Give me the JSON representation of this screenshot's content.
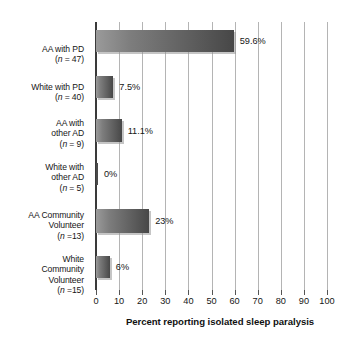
{
  "chart_data": {
    "type": "bar",
    "orientation": "horizontal",
    "title": "",
    "xlabel": "Percent reporting isolated sleep paralysis",
    "ylabel": "",
    "xlim": [
      0,
      100
    ],
    "xticks": [
      0,
      10,
      20,
      30,
      40,
      50,
      60,
      70,
      80,
      90,
      100
    ],
    "xtick_labels": [
      "0",
      "10",
      "20",
      "30",
      "40",
      "50",
      "60",
      "70",
      "80",
      "90",
      "100"
    ],
    "grid": "vertical",
    "legend": "none",
    "categories": [
      "AA with PD (n = 47)",
      "White with PD (n = 40)",
      "AA with other AD (n = 9)",
      "White with other AD (n = 5)",
      "AA Community Volunteer (n =13)",
      "White Community Volunteer (n =15)"
    ],
    "values": [
      59.6,
      7.5,
      11.1,
      0,
      23,
      6
    ],
    "value_labels": [
      "59.6%",
      "7.5%",
      "11.1%",
      "0%",
      "23%",
      "6%"
    ],
    "bars": [
      {
        "label_lines": [
          "AA with PD"
        ],
        "n_prefix": "(",
        "n_italic": "n",
        "n_suffix": " = 47)",
        "value": 59.6,
        "value_label": "59.6%",
        "top": 8,
        "height": 22
      },
      {
        "label_lines": [
          "White with PD"
        ],
        "n_prefix": "(",
        "n_italic": "n",
        "n_suffix": " = 40)",
        "value": 7.5,
        "value_label": "7.5%",
        "top": 54,
        "height": 22
      },
      {
        "label_lines": [
          "AA with",
          "other AD"
        ],
        "n_prefix": "(",
        "n_italic": "n",
        "n_suffix": " = 9)",
        "value": 11.1,
        "value_label": "11.1%",
        "top": 97,
        "height": 23
      },
      {
        "label_lines": [
          "White with",
          "other AD"
        ],
        "n_prefix": "(",
        "n_italic": "n",
        "n_suffix": " = 5)",
        "value": 0,
        "value_label": "0%",
        "top": 141,
        "height": 22
      },
      {
        "label_lines": [
          "AA Community",
          "Volunteer"
        ],
        "n_prefix": "(",
        "n_italic": "n",
        "n_suffix": " =13)",
        "value": 23,
        "value_label": "23%",
        "top": 187,
        "height": 24
      },
      {
        "label_lines": [
          "White",
          "Community",
          "Volunteer"
        ],
        "n_prefix": "(",
        "n_italic": "n",
        "n_suffix": " =15)",
        "value": 6,
        "value_label": "6%",
        "top": 234,
        "height": 22
      }
    ],
    "colors": {
      "bar_gradient_start": "#9a9a9a",
      "bar_gradient_end": "#474747",
      "bar_shadow": "#969696",
      "gridline": "#b4b4b4",
      "axis": "#3a3a3a",
      "text": "#161616",
      "background": "#ffffff"
    },
    "label_geometry": {
      "label_tops": [
        22,
        60,
        96,
        140,
        188,
        232
      ]
    }
  }
}
